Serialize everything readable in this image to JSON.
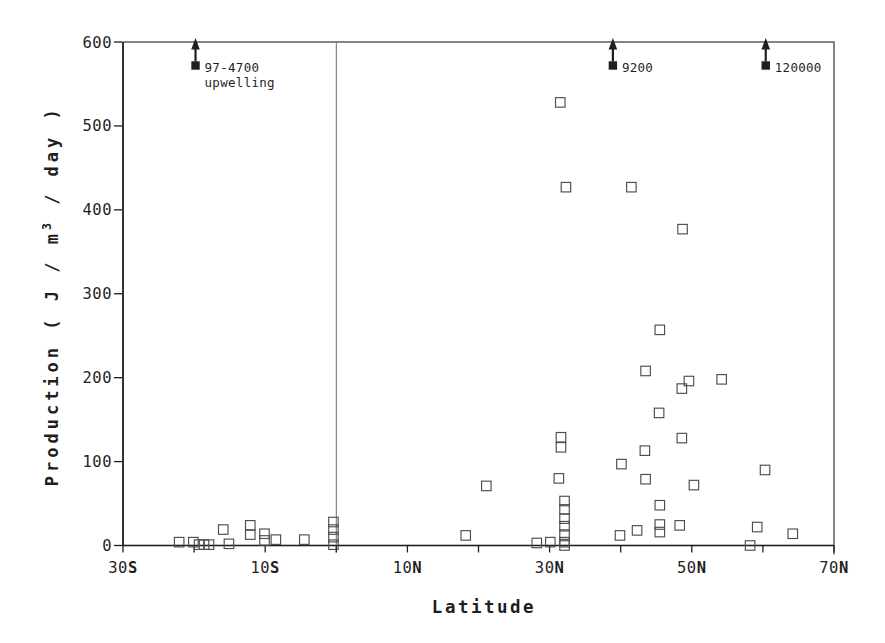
{
  "figure": {
    "background": "#ffffff",
    "ink_color": "#1f1f1f",
    "reference_line_color": "#5a5a5a",
    "marker_color": "#4d4d4d"
  },
  "chart_data": {
    "type": "scatter",
    "title": "",
    "xlabel": "Latitude",
    "ylabel": "Production ( J / m³ / day )",
    "ylabel_parts": [
      "Production ( J / m",
      "3",
      " / day )"
    ],
    "xlim": [
      -30,
      70
    ],
    "ylim": [
      0,
      600
    ],
    "grid": false,
    "marker": "open-square",
    "x_tick_values": [
      -30,
      -20,
      -10,
      0,
      10,
      20,
      30,
      40,
      50,
      60,
      70
    ],
    "x_tick_labels": [
      {
        "value": -30,
        "number": "30",
        "hemisphere": "S"
      },
      {
        "value": -10,
        "number": "10",
        "hemisphere": "S"
      },
      {
        "value": 10,
        "number": "10",
        "hemisphere": "N"
      },
      {
        "value": 30,
        "number": "30",
        "hemisphere": "N"
      },
      {
        "value": 50,
        "number": "50",
        "hemisphere": "N"
      },
      {
        "value": 70,
        "number": "70",
        "hemisphere": "N"
      }
    ],
    "y_tick_values": [
      0,
      100,
      200,
      300,
      400,
      500,
      600
    ],
    "reference_line_x": 0,
    "points": [
      [
        -22.1,
        4
      ],
      [
        -20.1,
        4
      ],
      [
        -19.3,
        1
      ],
      [
        -18.6,
        1
      ],
      [
        -17.9,
        1
      ],
      [
        -15.9,
        19
      ],
      [
        -15.1,
        2
      ],
      [
        -12.1,
        24
      ],
      [
        -12.1,
        13
      ],
      [
        -10.1,
        14
      ],
      [
        -10.1,
        6
      ],
      [
        -8.5,
        7
      ],
      [
        -4.5,
        7
      ],
      [
        -0.4,
        28
      ],
      [
        -0.4,
        19
      ],
      [
        -0.4,
        10
      ],
      [
        -0.4,
        1
      ],
      [
        18.2,
        12
      ],
      [
        21.1,
        71
      ],
      [
        28.2,
        3
      ],
      [
        30.1,
        4
      ],
      [
        31.5,
        528
      ],
      [
        32.3,
        427
      ],
      [
        31.6,
        129
      ],
      [
        31.6,
        117
      ],
      [
        31.3,
        80
      ],
      [
        32.1,
        53
      ],
      [
        32.1,
        43
      ],
      [
        32.1,
        32
      ],
      [
        32.1,
        23
      ],
      [
        32.1,
        13
      ],
      [
        32.1,
        4
      ],
      [
        32.1,
        0
      ],
      [
        39.9,
        12
      ],
      [
        40.1,
        97
      ],
      [
        41.5,
        427
      ],
      [
        42.3,
        18
      ],
      [
        43.4,
        113
      ],
      [
        43.5,
        208
      ],
      [
        43.5,
        79
      ],
      [
        45.4,
        158
      ],
      [
        45.5,
        257
      ],
      [
        45.5,
        48
      ],
      [
        45.5,
        25
      ],
      [
        45.5,
        16
      ],
      [
        48.3,
        24
      ],
      [
        48.6,
        187
      ],
      [
        48.6,
        128
      ],
      [
        48.7,
        377
      ],
      [
        49.6,
        196
      ],
      [
        50.3,
        72
      ],
      [
        54.2,
        198
      ],
      [
        58.2,
        0
      ],
      [
        59.2,
        22
      ],
      [
        60.3,
        90
      ],
      [
        64.2,
        14
      ]
    ],
    "offscale_points": [
      {
        "x": -19.8,
        "display_y": 572,
        "labels": [
          "97-4700",
          "upwelling"
        ]
      },
      {
        "x": 38.9,
        "display_y": 572,
        "labels": [
          "9200"
        ]
      },
      {
        "x": 60.4,
        "display_y": 572,
        "labels": [
          "120000"
        ]
      }
    ]
  }
}
